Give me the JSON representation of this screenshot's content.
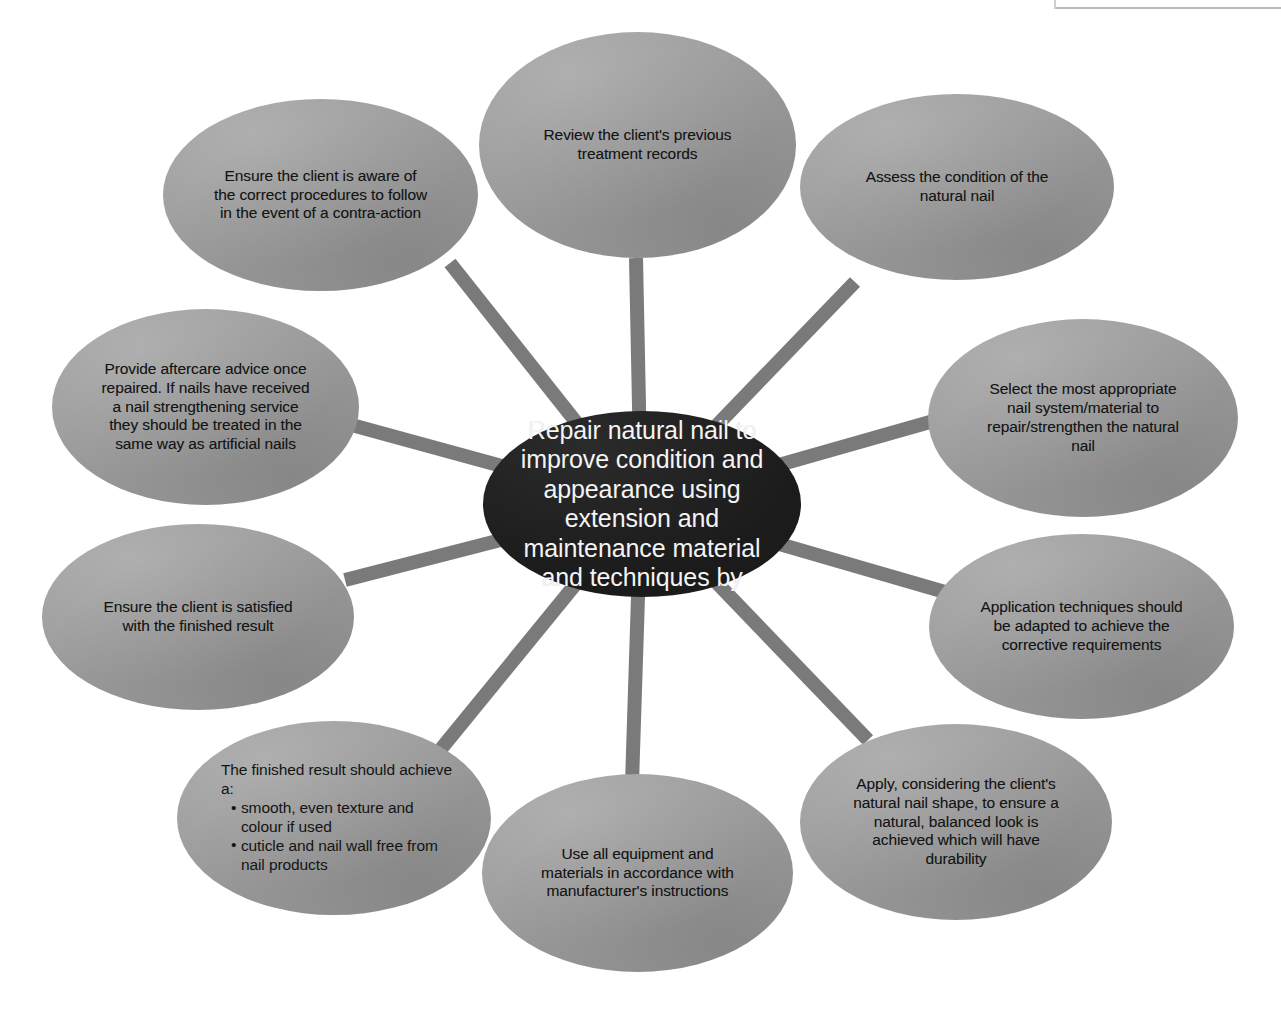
{
  "diagram": {
    "type": "hub-and-spoke",
    "title": "Repair natural nail to improve condition and appearance using extension and maintenance material and techniques by",
    "hub": {
      "label": "Repair natural nail to improve condition and appearance using extension and maintenance material and techniques by",
      "fill": "#1b1b1b",
      "text_color": "#f4f4f4"
    },
    "style": {
      "node_fill": "#9b9b9b",
      "node_text_color": "#141414",
      "spoke_color": "#7a7a7a",
      "background": "#ffffff",
      "spoke_width_px": 14
    },
    "nodes": [
      {
        "id": "review-records",
        "label": "Review the client's previous treatment records",
        "position": "top"
      },
      {
        "id": "assess-condition",
        "label": "Assess the condition of the natural nail",
        "position": "top-right"
      },
      {
        "id": "select-system",
        "label": "Select the most appropriate nail system/material to repair/strengthen the natural nail",
        "position": "right-upper"
      },
      {
        "id": "application-techniques",
        "label": "Application techniques should be adapted to achieve the corrective requirements",
        "position": "right-lower"
      },
      {
        "id": "apply-nail-shape",
        "label": "Apply, considering the client's natural nail shape, to ensure a natural, balanced look is achieved which will have durability",
        "position": "bottom-right"
      },
      {
        "id": "use-equipment",
        "label": "Use all equipment and materials in accordance with manufacturer's instructions",
        "position": "bottom"
      },
      {
        "id": "finished-result",
        "label": "The finished result should achieve a:",
        "bullets": [
          "smooth, even texture and colour if used",
          "cuticle and nail wall free from nail products"
        ],
        "position": "bottom-left"
      },
      {
        "id": "client-satisfied",
        "label": "Ensure the client is satisfied with the finished result",
        "position": "left-lower"
      },
      {
        "id": "aftercare-advice",
        "label": "Provide aftercare advice once repaired. If nails have received a nail strengthening service they should be treated in the same way as artificial nails",
        "position": "left-upper"
      },
      {
        "id": "contra-action",
        "label": "Ensure the client is aware of the correct procedures to follow in the event of a contra-action",
        "position": "top-left"
      }
    ]
  }
}
